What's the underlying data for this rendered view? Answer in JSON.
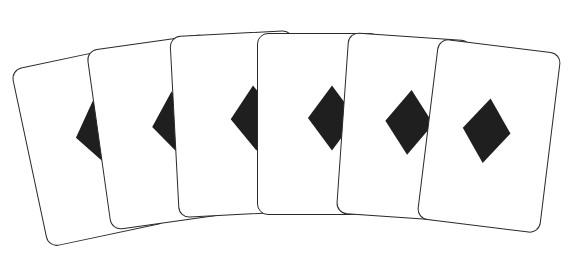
{
  "scene": {
    "description": "Fan of six playing cards, each showing a single black diamond",
    "background_color": "#ffffff",
    "card_border_color": "#2a2a2a",
    "suit_color": "#1f1f1f",
    "suit_icon": "diamond-icon"
  },
  "cards": [
    {
      "id": 1,
      "suit": "diamond",
      "cx": 90,
      "cy": 146,
      "rot": -12,
      "dx": 13,
      "dy": -10
    },
    {
      "id": 2,
      "suit": "diamond",
      "cx": 160,
      "cy": 132,
      "rot": -8,
      "dx": 18,
      "dy": -5
    },
    {
      "id": 3,
      "suit": "diamond",
      "cx": 236,
      "cy": 124,
      "rot": -3,
      "dx": 20,
      "dy": -4
    },
    {
      "id": 4,
      "suit": "diamond",
      "cx": 319,
      "cy": 124,
      "rot": 0,
      "dx": 14,
      "dy": -5
    },
    {
      "id": 5,
      "suit": "diamond",
      "cx": 404,
      "cy": 127,
      "rot": 4,
      "dx": 6,
      "dy": -4
    },
    {
      "id": 6,
      "suit": "diamond",
      "cx": 489,
      "cy": 136,
      "rot": 7,
      "dx": -2,
      "dy": -4
    }
  ]
}
